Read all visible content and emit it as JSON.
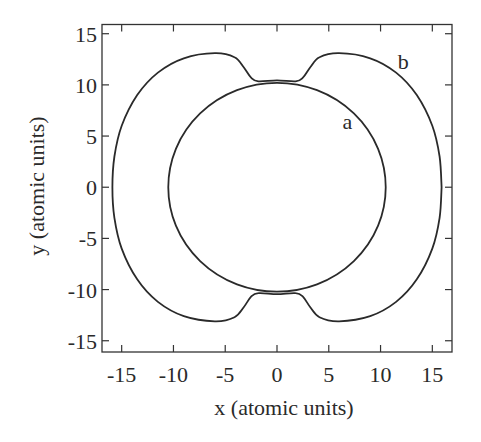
{
  "chart_data": {
    "type": "line",
    "title": "",
    "xlabel": "x (atomic units)",
    "ylabel": "y (atomic units)",
    "xlim": [
      -16.9,
      16.9
    ],
    "ylim": [
      -16.1,
      15.9
    ],
    "grid": false,
    "legend": "none (curves labeled inline)",
    "x_ticks": [
      -15,
      -10,
      -5,
      0,
      5,
      10,
      15
    ],
    "x_tick_labels": [
      "-15",
      "-10",
      "-5",
      "0",
      "5",
      "10",
      "15"
    ],
    "y_ticks": [
      15,
      10,
      5,
      0,
      -5,
      -10,
      -15
    ],
    "y_tick_labels": [
      "15",
      "10",
      "5",
      "0",
      "-5",
      "-10",
      "-15"
    ],
    "series": [
      {
        "name": "a",
        "shape": "closed curve (near-circle centered at origin)",
        "x": [
          10.5,
          9.09,
          5.25,
          0,
          -5.25,
          -9.09,
          -10.5,
          -9.09,
          -5.25,
          0,
          5.25,
          9.09,
          10.5
        ],
        "y": [
          0,
          5.1,
          8.83,
          10.2,
          8.83,
          5.1,
          0,
          -5.1,
          -8.83,
          -10.2,
          -8.83,
          -5.1,
          0
        ]
      },
      {
        "name": "b",
        "shape": "closed curve with pinched necks touching curve a near (0, ±10.3)",
        "x": [
          15.9,
          15.7,
          15.0,
          13.5,
          11.5,
          9.0,
          6.0,
          4.1,
          3.2,
          2.5,
          1.8,
          0,
          -1.8,
          -2.5,
          -3.2,
          -4.1,
          -6.0,
          -9.0,
          -11.5,
          -13.5,
          -15.0,
          -15.7,
          -15.9,
          -15.7,
          -15.0,
          -13.5,
          -11.5,
          -9.0,
          -6.0,
          -4.1,
          -3.2,
          -2.5,
          -1.8,
          0,
          1.8,
          2.5,
          3.2,
          4.1,
          6.0,
          9.0,
          11.5,
          13.5,
          15.0,
          15.7,
          15.9
        ],
        "y": [
          0,
          3.0,
          6.0,
          9.0,
          11.2,
          12.6,
          13.1,
          12.7,
          11.7,
          10.7,
          10.35,
          10.45,
          10.35,
          10.7,
          11.7,
          12.7,
          13.1,
          12.6,
          11.2,
          9.0,
          6.0,
          3.0,
          0,
          -3.0,
          -6.0,
          -9.0,
          -11.2,
          -12.6,
          -13.1,
          -12.7,
          -11.7,
          -10.7,
          -10.35,
          -10.45,
          -10.35,
          -10.7,
          -11.7,
          -12.7,
          -13.1,
          -12.6,
          -11.2,
          -9.0,
          -6.0,
          -3.0,
          0
        ]
      }
    ],
    "annotations": [
      {
        "text": "a",
        "x": 6.8,
        "y": 6.4
      },
      {
        "text": "b",
        "x": 12.2,
        "y": 12.2
      }
    ]
  },
  "labels": {
    "xlabel": "x (atomic units)",
    "ylabel": "y (atomic units)",
    "curve_a": "a",
    "curve_b": "b"
  }
}
